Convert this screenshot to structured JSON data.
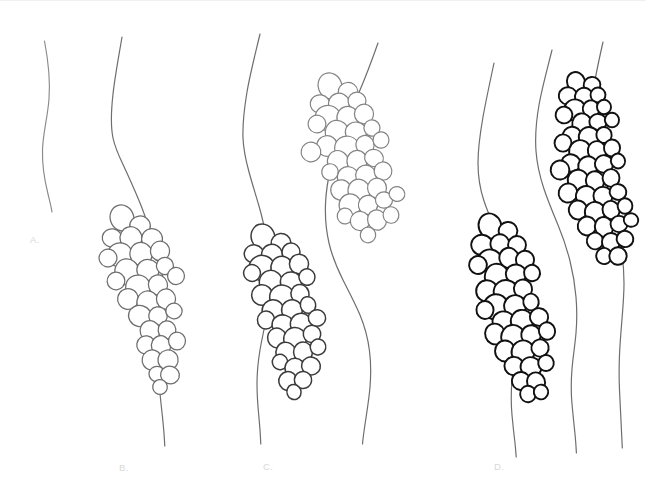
{
  "figure": {
    "background_color": "#ffffff",
    "width": 646,
    "height": 497,
    "label_color": "#d8d8d8",
    "top_rule_color": "#f0f0f0"
  },
  "panels": [
    {
      "id": "A",
      "label": "A.",
      "label_x": 30,
      "label_y": 243,
      "description": "single bare wavy line, no clusters",
      "cluster_count": 0,
      "line_count": 1
    },
    {
      "id": "B",
      "label": "B.",
      "label_x": 119,
      "label_y": 471,
      "description": "single wavy line with one medium-gray cluster of circles",
      "cluster_count": 1,
      "line_count": 1
    },
    {
      "id": "C",
      "label": "C.",
      "label_x": 263,
      "label_y": 470,
      "description": "two wavy lines, each bearing a cluster; left cluster dark, right cluster light gray and positioned higher",
      "cluster_count": 2,
      "line_count": 2
    },
    {
      "id": "D",
      "label": "D.",
      "label_x": 494,
      "label_y": 470,
      "description": "three wavy lines; leftmost and rightmost bear dense black clusters, middle line is bare",
      "cluster_count": 2,
      "line_count": 3
    }
  ],
  "strokes": {
    "line_light": "#8a8a8a",
    "line_medium": "#6e6e6e",
    "line_dark": "#3a3a3a",
    "circle_gray": "#6d6d6d",
    "circle_dark": "#3b3b3b",
    "circle_black": "#111111",
    "circle_light": "#838383",
    "fill": "#ffffff"
  },
  "lines": [
    {
      "name": "panel-a-line",
      "color_key": "line_light",
      "width": 1.15,
      "d": "M44.5,41 C48.5,62 50.5,80 49,99 C47.5,118 43,133 42.5,150 C42,167 45,182 48,194 C50.2,203 51.5,208 52,212"
    },
    {
      "name": "panel-b-line",
      "color_key": "line_medium",
      "width": 1.2,
      "d": "M122,37 C118.5,58 115,76 113,94 C111,112 110.5,126 113,138 C115.5,150 121,160 126,171 C131,182 136.5,194 142,208 C147,221 151,234 155,247 C159,260 162,272 164,283 C166,294 166.5,305 165.5,317 C164.5,329 162,342 160.5,354 C159,366 158.5,377 159.5,388 C160.5,400 162,412 163,422 C164,432 164.5,440 164.8,446"
    },
    {
      "name": "panel-c-left-line",
      "color_key": "line_medium",
      "width": 1.2,
      "d": "M260,34 C255,55 250,74 247,92 C244,110 242.5,125 243,138 C243.5,151 246,161 249,172 C252,183 255.5,194 259,206 C262.5,218 265,230 267,242 C269,254 270,266 270,278 C270,290 269,302 267,314 C265,326 262,338 260,350 C258,362 257,373 257,384 C257,396 258,408 259,418 C260,428 260.5,436 260.8,444"
    },
    {
      "name": "panel-c-right-line",
      "color_key": "line_medium",
      "width": 1.2,
      "d": "M378,43 C372,60 366,76 360,90 C354,104 348,117 343,130 C338,143 334,155 331,167 C328,179 326,191 325.5,204 C325,217 326,230 329,243 C332,256 337,268 343,280 C349,292 355,303 360,315 C365,327 368,339 369.5,351 C371,363 371,375 370,387 C369,399 367,411 365.5,421 C364,431 363,438 362.5,444"
    },
    {
      "name": "panel-d-left-line",
      "color_key": "line_medium",
      "width": 1.2,
      "d": "M494,63 C490,82 486,100 483,117 C480,134 478,149 478,163 C478,177 480,189 484,201 C488,213 493,224 498,236 C503,248 507,260 510,272 C513,284 515,296 516,308 C517,320 517,332 516,344 C515,356 513,368 512,380 C511,392 511,404 512,415 C513,426 514,435 515,443 C515.6,449 516,454 516.2,457"
    },
    {
      "name": "panel-d-middle-line",
      "color_key": "line_medium",
      "width": 1.2,
      "d": "M552,50 C547,70 542,88 539,105 C536,122 535,137 536,151 C537,165 540,177 544,189 C548,201 553,213 558,225 C563,237 567,249 570,261 C573,273 575,285 576,297 C577,309 577,321 576,333 C575,345 573,357 572,369 C571,381 571,393 572,404 C573,415 574,425 575,434 C575.8,442 576.2,449 576.4,453"
    },
    {
      "name": "panel-d-right-line",
      "color_key": "line_medium",
      "width": 1.2,
      "d": "M603,42 C599,60 595,77 593,93 C591,109 590,123 591,137 C592,151 595,163 599,175 C603,187 608,199 612,211 C616,223 619,235 621,247 C623,259 624,271 624,283 C624,295 623,307 622,319 C621,331 620,343 619.5,355 C619,367 619,379 619.5,390 C620,401 620.5,411 621,421 C621.5,431 622,440 622.3,448"
    }
  ],
  "clusters": [
    {
      "name": "panel-b-cluster",
      "stroke_key": "circle_gray",
      "stroke_width": 1.25,
      "circle_count": 32,
      "circles": [
        [
          122,
          218,
          12.5
        ],
        [
          140,
          226,
          10.5
        ],
        [
          112,
          238,
          9.5
        ],
        [
          131,
          238,
          11.5
        ],
        [
          152,
          239,
          10.5
        ],
        [
          120,
          255,
          12.0
        ],
        [
          141,
          254,
          11.5
        ],
        [
          160,
          251,
          9.5
        ],
        [
          108,
          258,
          8.5
        ],
        [
          127,
          272,
          12.5
        ],
        [
          148,
          270,
          11.0
        ],
        [
          165,
          266,
          9.0
        ],
        [
          116,
          281,
          9.0
        ],
        [
          138,
          287,
          12.0
        ],
        [
          158,
          285,
          10.0
        ],
        [
          176,
          276,
          8.5
        ],
        [
          128,
          299,
          10.0
        ],
        [
          148,
          303,
          11.5
        ],
        [
          166,
          299,
          9.5
        ],
        [
          140,
          316,
          11.0
        ],
        [
          158,
          316,
          9.5
        ],
        [
          174,
          311,
          8.0
        ],
        [
          150,
          331,
          10.5
        ],
        [
          167,
          330,
          9.0
        ],
        [
          146,
          345,
          9.0
        ],
        [
          161,
          346,
          10.0
        ],
        [
          177,
          341,
          8.5
        ],
        [
          152,
          360,
          9.5
        ],
        [
          168,
          360,
          10.5
        ],
        [
          157,
          374,
          8.0
        ],
        [
          170,
          375,
          9.0
        ],
        [
          160,
          387,
          7.5
        ]
      ]
    },
    {
      "name": "panel-c-left-cluster",
      "stroke_key": "circle_dark",
      "stroke_width": 1.5,
      "circle_count": 34,
      "circles": [
        [
          263,
          237,
          12.5
        ],
        [
          281,
          243,
          10.0
        ],
        [
          254,
          254,
          9.5
        ],
        [
          272,
          255,
          11.0
        ],
        [
          291,
          252,
          9.0
        ],
        [
          262,
          268,
          12.5
        ],
        [
          282,
          268,
          11.5
        ],
        [
          299,
          264,
          9.5
        ],
        [
          252,
          273,
          8.0
        ],
        [
          271,
          283,
          12.0
        ],
        [
          291,
          282,
          10.5
        ],
        [
          307,
          277,
          8.5
        ],
        [
          262,
          295,
          10.5
        ],
        [
          282,
          297,
          12.0
        ],
        [
          300,
          294,
          9.5
        ],
        [
          273,
          311,
          11.0
        ],
        [
          292,
          310,
          10.0
        ],
        [
          308,
          305,
          8.0
        ],
        [
          266,
          320,
          8.5
        ],
        [
          283,
          325,
          10.5
        ],
        [
          301,
          324,
          11.0
        ],
        [
          317,
          318,
          8.5
        ],
        [
          277,
          338,
          10.0
        ],
        [
          295,
          339,
          11.5
        ],
        [
          312,
          334,
          8.5
        ],
        [
          286,
          353,
          10.5
        ],
        [
          303,
          352,
          9.5
        ],
        [
          318,
          347,
          7.5
        ],
        [
          280,
          362,
          8.0
        ],
        [
          295,
          368,
          10.0
        ],
        [
          311,
          366,
          9.0
        ],
        [
          288,
          381,
          9.5
        ],
        [
          303,
          380,
          8.5
        ],
        [
          294,
          392,
          7.5
        ]
      ]
    },
    {
      "name": "panel-c-right-cluster",
      "stroke_key": "circle_light",
      "stroke_width": 1.2,
      "circle_count": 36,
      "circles": [
        [
          330,
          86,
          12.5
        ],
        [
          348,
          92,
          10.0
        ],
        [
          320,
          104,
          9.5
        ],
        [
          339,
          104,
          11.0
        ],
        [
          357,
          101,
          9.0
        ],
        [
          328,
          118,
          12.5
        ],
        [
          348,
          118,
          11.5
        ],
        [
          364,
          114,
          9.5
        ],
        [
          317,
          124,
          8.5
        ],
        [
          337,
          133,
          12.0
        ],
        [
          356,
          132,
          10.5
        ],
        [
          372,
          128,
          8.5
        ],
        [
          327,
          146,
          10.5
        ],
        [
          347,
          148,
          12.0
        ],
        [
          365,
          145,
          9.5
        ],
        [
          381,
          140,
          8.0
        ],
        [
          311,
          152,
          9.5
        ],
        [
          338,
          162,
          11.0
        ],
        [
          357,
          161,
          10.0
        ],
        [
          374,
          158,
          9.0
        ],
        [
          330,
          172,
          8.5
        ],
        [
          348,
          177,
          10.5
        ],
        [
          366,
          176,
          11.0
        ],
        [
          383,
          171,
          9.0
        ],
        [
          341,
          190,
          10.0
        ],
        [
          359,
          191,
          11.5
        ],
        [
          377,
          188,
          9.5
        ],
        [
          350,
          205,
          10.5
        ],
        [
          368,
          205,
          10.0
        ],
        [
          384,
          200,
          8.5
        ],
        [
          397,
          194,
          7.5
        ],
        [
          345,
          216,
          8.0
        ],
        [
          360,
          221,
          9.5
        ],
        [
          377,
          220,
          10.0
        ],
        [
          391,
          215,
          8.0
        ],
        [
          368,
          235,
          7.5
        ]
      ]
    },
    {
      "name": "panel-d-left-cluster",
      "stroke_key": "circle_black",
      "stroke_width": 1.9,
      "circle_count": 36,
      "circles": [
        [
          490,
          226,
          12.0
        ],
        [
          508,
          231,
          9.5
        ],
        [
          482,
          245,
          10.5
        ],
        [
          500,
          244,
          10.0
        ],
        [
          517,
          245,
          9.0
        ],
        [
          490,
          261,
          11.5
        ],
        [
          509,
          258,
          10.0
        ],
        [
          525,
          260,
          9.0
        ],
        [
          478,
          265,
          8.5
        ],
        [
          497,
          277,
          12.5
        ],
        [
          516,
          274,
          10.0
        ],
        [
          532,
          273,
          8.5
        ],
        [
          487,
          291,
          11.0
        ],
        [
          506,
          292,
          12.0
        ],
        [
          523,
          289,
          9.5
        ],
        [
          496,
          307,
          12.5
        ],
        [
          515,
          306,
          10.5
        ],
        [
          531,
          302,
          8.0
        ],
        [
          485,
          310,
          8.5
        ],
        [
          504,
          322,
          11.0
        ],
        [
          522,
          321,
          11.5
        ],
        [
          539,
          317,
          9.0
        ],
        [
          495,
          334,
          10.5
        ],
        [
          513,
          337,
          12.0
        ],
        [
          531,
          335,
          9.5
        ],
        [
          547,
          331,
          8.5
        ],
        [
          505,
          351,
          10.0
        ],
        [
          523,
          352,
          11.0
        ],
        [
          540,
          348,
          9.0
        ],
        [
          514,
          366,
          9.5
        ],
        [
          531,
          367,
          10.0
        ],
        [
          546,
          363,
          8.0
        ],
        [
          521,
          381,
          9.0
        ],
        [
          536,
          382,
          9.5
        ],
        [
          528,
          394,
          8.0
        ],
        [
          541,
          392,
          7.0
        ]
      ]
    },
    {
      "name": "panel-d-right-cluster",
      "stroke_key": "circle_black",
      "stroke_width": 1.9,
      "circle_count": 44,
      "circles": [
        [
          576,
          82,
          9.5
        ],
        [
          592,
          85,
          8.5
        ],
        [
          568,
          96,
          9.0
        ],
        [
          584,
          97,
          9.5
        ],
        [
          598,
          95,
          7.5
        ],
        [
          575,
          110,
          10.5
        ],
        [
          591,
          109,
          8.5
        ],
        [
          604,
          107,
          7.0
        ],
        [
          564,
          115,
          8.0
        ],
        [
          582,
          124,
          10.0
        ],
        [
          598,
          122,
          8.5
        ],
        [
          612,
          120,
          7.5
        ],
        [
          572,
          136,
          9.5
        ],
        [
          589,
          137,
          10.0
        ],
        [
          604,
          135,
          8.0
        ],
        [
          563,
          143,
          8.5
        ],
        [
          580,
          151,
          10.5
        ],
        [
          597,
          151,
          9.5
        ],
        [
          612,
          148,
          8.0
        ],
        [
          571,
          163,
          9.0
        ],
        [
          588,
          166,
          10.0
        ],
        [
          604,
          164,
          9.0
        ],
        [
          618,
          161,
          7.5
        ],
        [
          560,
          170,
          9.5
        ],
        [
          578,
          180,
          10.0
        ],
        [
          595,
          181,
          9.5
        ],
        [
          611,
          178,
          8.5
        ],
        [
          568,
          193,
          9.0
        ],
        [
          586,
          196,
          10.5
        ],
        [
          603,
          196,
          9.5
        ],
        [
          618,
          192,
          8.0
        ],
        [
          578,
          210,
          9.5
        ],
        [
          595,
          212,
          10.0
        ],
        [
          611,
          210,
          9.0
        ],
        [
          625,
          206,
          7.5
        ],
        [
          587,
          226,
          9.0
        ],
        [
          604,
          227,
          9.5
        ],
        [
          619,
          224,
          8.5
        ],
        [
          631,
          220,
          7.0
        ],
        [
          595,
          241,
          8.5
        ],
        [
          611,
          242,
          9.0
        ],
        [
          625,
          239,
          8.0
        ],
        [
          604,
          256,
          8.0
        ],
        [
          618,
          256,
          8.5
        ]
      ]
    }
  ]
}
